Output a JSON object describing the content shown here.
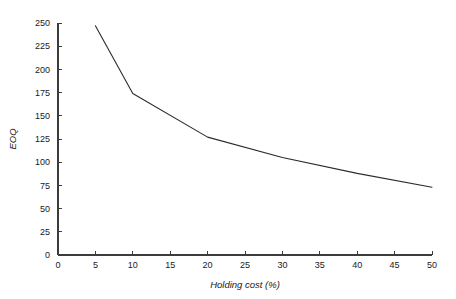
{
  "chart_data": {
    "type": "line",
    "title": "",
    "subtitle": "",
    "xlabel": "Holding cost (%)",
    "ylabel": "EOQ",
    "xlim": [
      0,
      50
    ],
    "ylim": [
      0,
      250
    ],
    "grid": false,
    "legend": null,
    "legend_position": "none",
    "line_color": "#2b2b2b",
    "axis_color": "#3c3c3c",
    "background_color": "#ffffff",
    "x_ticks": [
      0,
      5,
      10,
      15,
      20,
      25,
      30,
      35,
      40,
      45,
      50
    ],
    "x_tick_labels": [
      "0",
      "5",
      "10",
      "15",
      "20",
      "25",
      "30",
      "35",
      "40",
      "45",
      "50"
    ],
    "y_ticks": [
      0,
      25,
      50,
      75,
      100,
      125,
      150,
      175,
      200,
      225,
      250
    ],
    "y_tick_labels": [
      "0",
      "25",
      "50",
      "75",
      "100",
      "125",
      "150",
      "175",
      "200",
      "225",
      "250"
    ],
    "series": [
      {
        "name": "EOQ",
        "x": [
          5,
          10,
          20,
          30,
          40,
          50
        ],
        "values": [
          247,
          174,
          127,
          105,
          88,
          73
        ]
      }
    ]
  }
}
